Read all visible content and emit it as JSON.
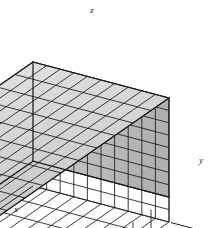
{
  "figure": {
    "background_color": "#ffffff",
    "line_color": "#1a1a1a",
    "width": 213,
    "height": 228
  },
  "axes": [
    {
      "id": "x",
      "label": "x",
      "label_x": 16,
      "label_y": 212,
      "direction": "down-left"
    },
    {
      "id": "y",
      "label": "y",
      "label_x": 201,
      "label_y": 163,
      "direction": "right"
    },
    {
      "id": "z",
      "label": "z",
      "label_x": 92,
      "label_y": 13,
      "direction": "up"
    }
  ],
  "chart_data": {
    "type": "diagram",
    "subtype": "voxel-grid-cube",
    "projection": "axonometric",
    "divisions": {
      "x": 10,
      "y": 10,
      "z": 10
    },
    "origin_px": {
      "x": 33,
      "y": 186
    },
    "axis_vectors_px": {
      "x": {
        "dx": -18.0,
        "dy": 12.5
      },
      "y": {
        "dx": 13.6,
        "dy": 3.6
      },
      "z": {
        "dx": 0.0,
        "dy": -12.4
      }
    },
    "shading": {
      "top_face": "#d8d8d8",
      "left_face": "#8f8f8f",
      "right_face": "#bdbdbd",
      "base_wireframe": "#ffffff",
      "interior_block": "#7a7a7a"
    },
    "notes": [
      "Unit cube subdivided into a 10 x 10 x 10 lattice of small cubes",
      "Upper portion rendered as shaded solid voxels",
      "Lowest two layers rendered as open wireframe",
      "Axes x, y, z drawn with arrowheads from the front-lower-left origin"
    ]
  }
}
